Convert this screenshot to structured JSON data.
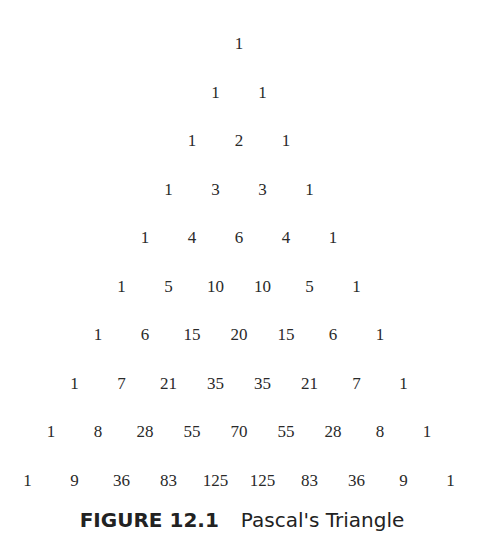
{
  "figure": {
    "rows": [
      [
        "1"
      ],
      [
        "1",
        "1"
      ],
      [
        "1",
        "2",
        "1"
      ],
      [
        "1",
        "3",
        "3",
        "1"
      ],
      [
        "1",
        "4",
        "6",
        "4",
        "1"
      ],
      [
        "1",
        "5",
        "10",
        "10",
        "5",
        "1"
      ],
      [
        "1",
        "6",
        "15",
        "20",
        "15",
        "6",
        "1"
      ],
      [
        "1",
        "7",
        "21",
        "35",
        "35",
        "21",
        "7",
        "1"
      ],
      [
        "1",
        "8",
        "28",
        "55",
        "70",
        "55",
        "28",
        "8",
        "1"
      ],
      [
        "1",
        "9",
        "36",
        "83",
        "125",
        "125",
        "83",
        "36",
        "9",
        "1"
      ]
    ],
    "caption": {
      "label": "FIGURE 12.1",
      "title": "Pascal's Triangle"
    }
  }
}
